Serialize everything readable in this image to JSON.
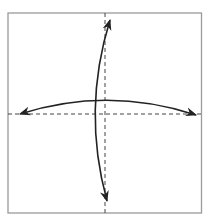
{
  "diagram": {
    "type": "origami-fold-diagram",
    "paper": {
      "x": 8,
      "y": 13,
      "width": 194,
      "height": 200,
      "border_color": "#9a9a9a",
      "fill": "#ffffff"
    },
    "fold_lines": [
      {
        "name": "vertical-center-fold",
        "style": "dashed",
        "x1": 105,
        "y1": 13,
        "x2": 105,
        "y2": 213
      },
      {
        "name": "horizontal-center-fold",
        "style": "dashed",
        "x1": 8,
        "y1": 114,
        "x2": 202,
        "y2": 114
      }
    ],
    "arrows": [
      {
        "name": "vertical-fold-unfold-arrow",
        "type": "double-headed-arc",
        "from": [
          110,
          18
        ],
        "to": [
          107,
          203
        ]
      },
      {
        "name": "horizontal-fold-unfold-arrow",
        "type": "double-headed-arc",
        "from": [
          18,
          114
        ],
        "to": [
          198,
          115
        ]
      }
    ],
    "colors": {
      "line": "#222222",
      "dash": "#444444",
      "border": "#9a9a9a"
    }
  }
}
